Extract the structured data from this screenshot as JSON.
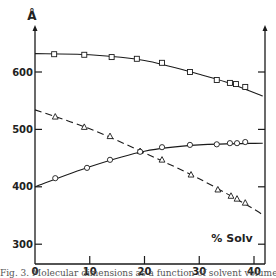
{
  "chart_data": {
    "type": "line",
    "title": "",
    "xlabel": "% Solv",
    "ylabel": "Å",
    "xlim": [
      0,
      42
    ],
    "ylim": [
      270,
      690
    ],
    "grid": false,
    "legend": null,
    "x_ticks": [
      0,
      10,
      20,
      30,
      40
    ],
    "y_ticks": [
      300,
      400,
      500,
      600
    ],
    "series": [
      {
        "name": "squares",
        "marker": "square",
        "line_style": "solid",
        "x": [
          3.5,
          9,
          14,
          18.6,
          23.2,
          28.3,
          33.2,
          35.6,
          36.7,
          38.4
        ],
        "y": [
          631,
          630,
          626,
          623,
          616,
          600,
          586,
          581,
          579,
          574
        ],
        "curve": [
          [
            0,
            632
          ],
          [
            10,
            630
          ],
          [
            20,
            620
          ],
          [
            30,
            596
          ],
          [
            35,
            582
          ],
          [
            41.6,
            558
          ]
        ]
      },
      {
        "name": "triangles",
        "marker": "triangle",
        "line_style": "dashed",
        "x": [
          3.7,
          9,
          13.7,
          19.2,
          23.2,
          28.5,
          33.4,
          35.8,
          36.9,
          38.4
        ],
        "y": [
          522,
          504,
          488,
          462,
          447,
          421,
          395,
          384,
          379,
          372
        ],
        "curve": [
          [
            0,
            534
          ],
          [
            10,
            501
          ],
          [
            20,
            459
          ],
          [
            30,
            414
          ],
          [
            40,
            361
          ],
          [
            41.6,
            349
          ]
        ]
      },
      {
        "name": "circles",
        "marker": "circle",
        "line_style": "solid",
        "x": [
          3.7,
          9.5,
          13.7,
          19.2,
          23.2,
          28.3,
          33.2,
          35.6,
          36.9,
          38.4
        ],
        "y": [
          415,
          433,
          447,
          461,
          469,
          473,
          474,
          476,
          476,
          478
        ],
        "curve": [
          [
            0,
            400
          ],
          [
            10,
            435
          ],
          [
            20,
            462
          ],
          [
            30,
            473
          ],
          [
            41.6,
            476
          ]
        ]
      }
    ],
    "annotations": [
      "% Solv"
    ]
  },
  "labels": {
    "y_unit": "Å",
    "x_title": "% Solv",
    "x_ticks": [
      "0",
      "10",
      "20",
      "30",
      "40"
    ],
    "y_ticks": [
      "300",
      "400",
      "500",
      "600"
    ]
  },
  "caption": "Fig. 3. Molecular dimensions as a function of solvent volume fraction (%)."
}
